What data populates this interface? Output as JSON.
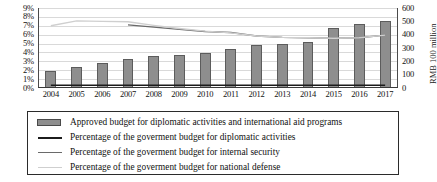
{
  "chart_data": {
    "type": "bar",
    "title": "",
    "subtitle": "",
    "xlabel": "",
    "ylabel": "",
    "ylabel_right": "RMB 100 million",
    "grid": true,
    "legend_position": "bottom",
    "categories": [
      "2004",
      "2005",
      "2006",
      "2007",
      "2008",
      "2009",
      "2010",
      "2011",
      "2012",
      "2013",
      "2014",
      "2015",
      "2016",
      "2017"
    ],
    "left_axis": {
      "ticks": [
        "0%",
        "1%",
        "2%",
        "3%",
        "4%",
        "5%",
        "6%",
        "7%",
        "8%",
        "9%"
      ],
      "values": [
        0,
        1,
        2,
        3,
        4,
        5,
        6,
        7,
        8,
        9
      ],
      "min": 0,
      "max": 9,
      "unit": "%"
    },
    "right_axis": {
      "ticks": [
        "0",
        "100",
        "200",
        "300",
        "400",
        "500",
        "600"
      ],
      "values": [
        0,
        100,
        200,
        300,
        400,
        500,
        600
      ],
      "min": 0,
      "max": 600,
      "title": "RMB 100 million"
    },
    "series": [
      {
        "name": "Approved budget for diplomatic activities and international aid programs",
        "type": "bar",
        "axis": "right",
        "unit": "RMB 100 million",
        "color": "#8e8e8e",
        "values": [
          130,
          155,
          185,
          215,
          240,
          245,
          260,
          290,
          320,
          328,
          348,
          450,
          480,
          505
        ],
        "values_pct_equivalent": [
          2.3,
          2.7,
          3.2,
          3.7,
          4.15,
          4.2,
          4.45,
          5.0,
          5.5,
          5.6,
          5.95,
          7.7,
          8.2,
          8.6
        ]
      },
      {
        "name": "Percentage of the goverment budget for diplomatic activities",
        "type": "line",
        "axis": "left",
        "unit": "%",
        "color": "#1c1c1c",
        "values": [
          0.3,
          0.3,
          0.3,
          0.3,
          0.3,
          0.3,
          0.3,
          0.3,
          0.3,
          0.3,
          0.3,
          0.3,
          0.3,
          0.3
        ]
      },
      {
        "name": "Percentage of the goverment budget for internal security",
        "type": "line",
        "axis": "left",
        "unit": "%",
        "color": "#6a6a6a",
        "values": [
          null,
          null,
          null,
          7.1,
          6.85,
          6.6,
          6.35,
          6.25,
          5.85,
          5.7,
          5.65,
          5.6,
          5.65,
          5.95
        ]
      },
      {
        "name": "Percentage of the goverment budget for national defense",
        "type": "line",
        "axis": "left",
        "unit": "%",
        "color": "#cfcfcf",
        "values": [
          7.0,
          7.55,
          7.5,
          7.45,
          7.05,
          6.7,
          6.4,
          6.2,
          5.85,
          5.7,
          5.65,
          5.6,
          5.65,
          5.95
        ]
      }
    ],
    "legend": [
      {
        "key": "bar",
        "label": "Approved budget for diplomatic activities and international aid programs"
      },
      {
        "key": "line-dark",
        "label": "Percentage of the goverment budget for diplomatic activities"
      },
      {
        "key": "line-mid",
        "label": "Percentage of the goverment budget for internal security"
      },
      {
        "key": "line-light",
        "label": "Percentage of the goverment budget for national defense"
      }
    ]
  }
}
